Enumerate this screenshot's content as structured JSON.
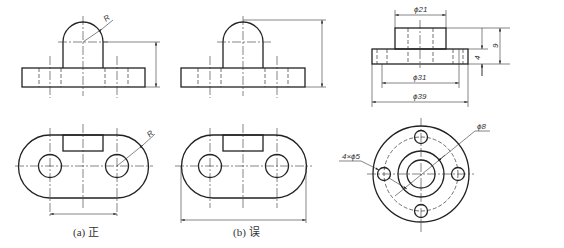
{
  "figure": {
    "panel_a": {
      "caption": "(a) 正",
      "front_view": {
        "radius_label": "R"
      },
      "top_view": {
        "radius_label": "R"
      }
    },
    "panel_b": {
      "caption": "(b) 误"
    },
    "panel_c": {
      "dimensions": {
        "boss_diameter": "ϕ21",
        "bolt_circle_diameter": "ϕ31",
        "flange_diameter": "ϕ39",
        "flange_thickness": "4",
        "total_height": "9",
        "bore_diameter": "ϕ8",
        "holes": "4×ϕ5"
      }
    }
  },
  "colors": {
    "line": "#222222",
    "background": "#ffffff"
  }
}
